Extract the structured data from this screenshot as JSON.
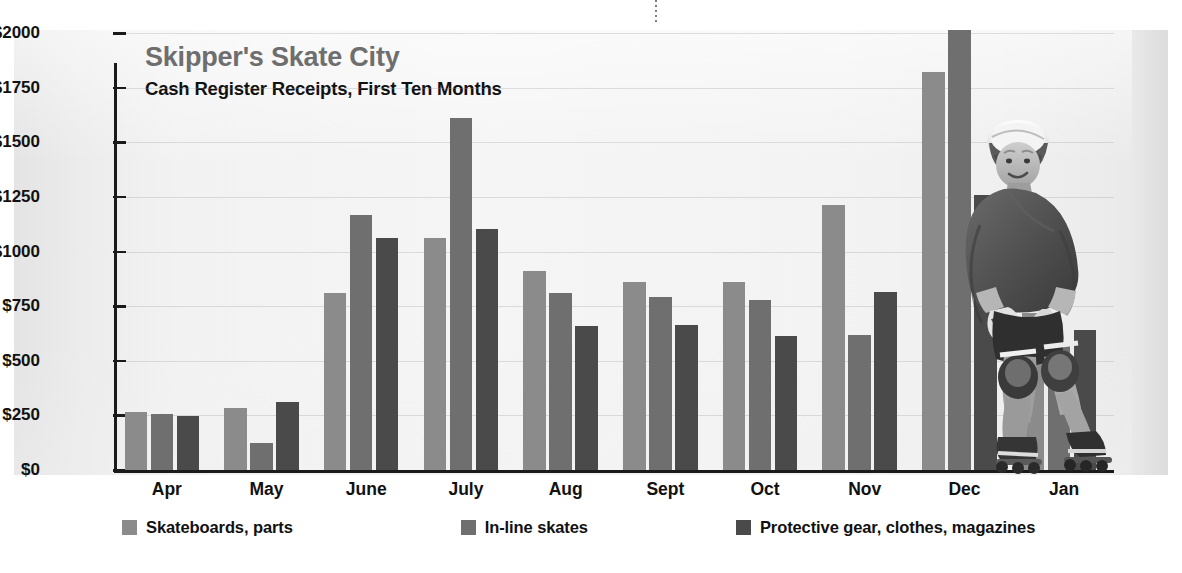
{
  "chart_data": {
    "type": "bar",
    "title": "Skipper's Skate City",
    "subtitle": "Cash Register Receipts, First Ten Months",
    "xlabel": "",
    "ylabel": "",
    "ylim": [
      0,
      2000
    ],
    "ytick_values": [
      2000,
      1750,
      1500,
      1250,
      1000,
      750,
      500,
      250,
      0
    ],
    "ytick_labels": [
      "$2000",
      "$1750",
      "$1500",
      "$1250",
      "$1000",
      "$750",
      "$500",
      "$250",
      "$0"
    ],
    "grid": true,
    "legend_position": "bottom-left",
    "categories": [
      "Apr",
      "May",
      "June",
      "July",
      "Aug",
      "Sept",
      "Oct",
      "Nov",
      "Dec",
      "Jan"
    ],
    "series": [
      {
        "name": "Skateboards, parts",
        "color": "#8b8b8b",
        "values": [
          265,
          285,
          810,
          1060,
          910,
          860,
          860,
          1215,
          1820,
          720
        ]
      },
      {
        "name": "In-line skates",
        "color": "#6f6f6f",
        "values": [
          255,
          125,
          1165,
          1610,
          810,
          790,
          780,
          620,
          2015,
          570
        ]
      },
      {
        "name": "Protective gear, clothes, magazines",
        "color": "#4a4a4a",
        "values": [
          245,
          310,
          1060,
          1105,
          660,
          665,
          615,
          815,
          1260,
          640
        ]
      }
    ]
  },
  "colors": {
    "series1": "#8b8b8b",
    "series2": "#6f6f6f",
    "series3": "#4a4a4a",
    "title": "#6e6e6e",
    "subtitle": "#111111",
    "axis": "#1a1a1a",
    "panel_background": "#f2f2f2"
  },
  "photo": {
    "alt_name": "inline-skater-photo",
    "description": "Grayscale photograph of a smiling person in a white helmet, dark long-sleeve top, shorts, knee pads, elbow pads and wrist guards, riding inline skates"
  }
}
